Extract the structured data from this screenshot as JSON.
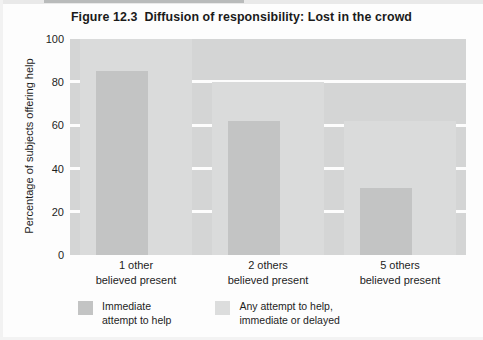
{
  "figure": {
    "number": "Figure 12.3",
    "title": "Diffusion of responsibility: Lost in the crowd"
  },
  "axes": {
    "ylabel": "Percentage of subjects offering help",
    "yticks": [
      "100",
      "80",
      "60",
      "40",
      "20",
      "0"
    ]
  },
  "categories": [
    {
      "line1": "1 other",
      "line2": "believed present"
    },
    {
      "line1": "2 others",
      "line2": "believed present"
    },
    {
      "line1": "5 others",
      "line2": "believed present"
    }
  ],
  "legend": [
    {
      "line1": "Immediate",
      "line2": "attempt to help",
      "color": "#c3c4c4"
    },
    {
      "line1": "Any attempt to help,",
      "line2": "immediate or delayed",
      "color": "#dcdddd"
    }
  ],
  "colors": {
    "plot_background": "#d4d5d5",
    "gridline": "#fdfdfd",
    "series_immediate": "#c3c4c4",
    "series_any": "#dadbdb",
    "text": "#1d1d1d"
  },
  "chart_data": {
    "type": "bar",
    "xlabel": "",
    "ylabel": "Percentage of subjects offering help",
    "ylim": [
      0,
      100
    ],
    "yticks": [
      0,
      20,
      40,
      60,
      80,
      100
    ],
    "grid": true,
    "legend_position": "bottom",
    "categories": [
      "1 other believed present",
      "2 others believed present",
      "5 others believed present"
    ],
    "series": [
      {
        "name": "Immediate attempt to help",
        "color": "#c3c4c4",
        "values": [
          85,
          62,
          31
        ]
      },
      {
        "name": "Any attempt to help, immediate or delayed",
        "color": "#dadbdb",
        "values": [
          100,
          80,
          62
        ]
      }
    ]
  }
}
